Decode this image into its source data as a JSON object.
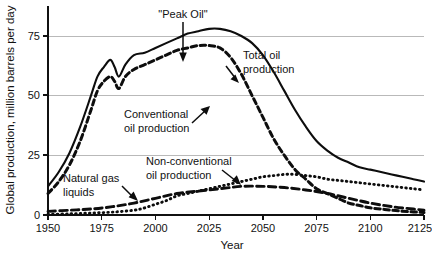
{
  "chart_data": {
    "type": "line",
    "title": "",
    "xlabel": "Year",
    "ylabel": "Global production, million barrels per day",
    "xlim": [
      1950,
      2125
    ],
    "ylim": [
      0,
      82
    ],
    "xticks": [
      1950,
      1975,
      2000,
      2025,
      2050,
      2075,
      2100,
      2125
    ],
    "xtick_labels": [
      "1950",
      "1975",
      "2000",
      "2025",
      "2050",
      "2075",
      "2100",
      "2125"
    ],
    "yticks": [
      0,
      25,
      50,
      75
    ],
    "ytick_labels": [
      "0",
      "25",
      "50",
      "75"
    ],
    "grid": "horizontal",
    "legend_position": "inline-annotations",
    "series": [
      {
        "name": "Total oil production",
        "style": "solid",
        "color": "#0d0d0d",
        "x": [
          1950,
          1955,
          1960,
          1965,
          1970,
          1973,
          1976,
          1979,
          1981,
          1983,
          1986,
          1990,
          1995,
          2000,
          2005,
          2010,
          2015,
          2020,
          2025,
          2030,
          2035,
          2040,
          2045,
          2050,
          2055,
          2060,
          2065,
          2070,
          2075,
          2080,
          2085,
          2090,
          2095,
          2100,
          2105,
          2110,
          2115,
          2120,
          2125
        ],
        "y": [
          12,
          18,
          26,
          37,
          50,
          58,
          62,
          65,
          62,
          58,
          63,
          67,
          68,
          70,
          72,
          74,
          76,
          77,
          78,
          78,
          77,
          75,
          72,
          67,
          60,
          52,
          44,
          37,
          31,
          27,
          24,
          22,
          20,
          19,
          18,
          17,
          16,
          15,
          14
        ]
      },
      {
        "name": "Conventional oil production",
        "style": "dashed-heavy",
        "color": "#0d0d0d",
        "x": [
          1950,
          1955,
          1960,
          1965,
          1970,
          1973,
          1976,
          1979,
          1981,
          1983,
          1986,
          1990,
          1995,
          2000,
          2005,
          2010,
          2015,
          2020,
          2025,
          2030,
          2035,
          2040,
          2045,
          2050,
          2055,
          2060,
          2065,
          2070,
          2075,
          2080,
          2085,
          2090,
          2095,
          2100,
          2105,
          2110,
          2115,
          2120,
          2125
        ],
        "y": [
          9,
          14,
          21,
          31,
          44,
          52,
          56,
          58,
          56,
          53,
          58,
          61,
          63,
          65,
          67,
          69,
          70,
          71,
          71,
          70,
          66,
          59,
          50,
          41,
          32,
          25,
          19,
          15,
          11,
          9,
          7,
          5,
          4,
          3,
          2.5,
          2,
          1.6,
          1.3,
          1
        ]
      },
      {
        "name": "Natural gas liquids",
        "style": "dashed-long",
        "color": "#0d0d0d",
        "x": [
          1950,
          1960,
          1970,
          1980,
          1990,
          2000,
          2010,
          2020,
          2030,
          2040,
          2050,
          2060,
          2070,
          2080,
          2090,
          2100,
          2110,
          2120,
          2125
        ],
        "y": [
          1.5,
          2,
          2.5,
          3.5,
          5,
          7,
          9,
          10,
          11,
          12,
          12,
          11.5,
          10.5,
          9,
          7,
          5,
          3.5,
          2.5,
          2
        ]
      },
      {
        "name": "Non-conventional oil production",
        "style": "dotted",
        "color": "#0d0d0d",
        "x": [
          1950,
          1960,
          1970,
          1980,
          1990,
          1995,
          2000,
          2005,
          2010,
          2015,
          2020,
          2025,
          2030,
          2035,
          2040,
          2045,
          2050,
          2055,
          2060,
          2065,
          2070,
          2075,
          2080,
          2085,
          2090,
          2095,
          2100,
          2105,
          2110,
          2115,
          2120,
          2125
        ],
        "y": [
          0.3,
          0.5,
          0.8,
          1.2,
          2,
          3,
          4.5,
          6,
          8,
          9,
          10,
          11,
          12,
          13,
          14,
          15,
          16,
          16.5,
          17,
          17,
          16.5,
          16,
          15,
          14.5,
          14,
          13.5,
          13,
          12.5,
          12,
          11.5,
          11,
          10.5
        ]
      }
    ],
    "annotations": [
      {
        "name": "peak-oil",
        "text": "\"Peak Oil\"",
        "lines": [
          "\"Peak Oil\""
        ]
      },
      {
        "name": "total-oil",
        "text": "Total oil production",
        "lines": [
          "Total oil",
          "production"
        ]
      },
      {
        "name": "conventional",
        "text": "Conventional oil production",
        "lines": [
          "Conventional",
          "oil production"
        ]
      },
      {
        "name": "non-conventional",
        "text": "Non-conventional oil production",
        "lines": [
          "Non-conventional",
          "oil production"
        ]
      },
      {
        "name": "natural-gas-liquids",
        "text": "Natural gas liquids",
        "lines": [
          "Natural gas",
          "liquids"
        ]
      }
    ]
  },
  "axes": {
    "y_title": "Global production, million barrels per day",
    "x_title": "Year",
    "y_tick_0": "0",
    "y_tick_25": "25",
    "y_tick_50": "50",
    "y_tick_75": "75",
    "x_tick_1950": "1950",
    "x_tick_1975": "1975",
    "x_tick_2000": "2000",
    "x_tick_2025": "2025",
    "x_tick_2050": "2050",
    "x_tick_2075": "2075",
    "x_tick_2100": "2100",
    "x_tick_2125": "2125"
  },
  "annotations": {
    "peak_oil": "\"Peak Oil\"",
    "total_oil_line1": "Total oil",
    "total_oil_line2": "production",
    "conventional_line1": "Conventional",
    "conventional_line2": "oil production",
    "nonconventional_line1": "Non-conventional",
    "nonconventional_line2": "oil production",
    "ngl_line1": "Natural gas",
    "ngl_line2": "liquids"
  },
  "colors": {
    "ink": "#0d0d0d",
    "grid": "#b9b9b9",
    "background": "#ffffff"
  }
}
